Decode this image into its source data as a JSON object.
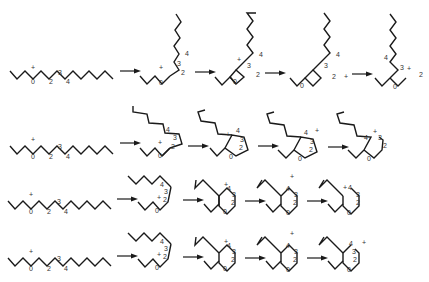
{
  "diagram": {
    "colors": {
      "bond": "#1a1a1a",
      "label": "#333333",
      "background": "#ffffff"
    },
    "rows": [
      {
        "id": "row-1",
        "description": "4-membered ring formation",
        "labels": {
          "c0": "0",
          "c2": "2",
          "c3": "3",
          "c4": "4",
          "charge": "+"
        }
      },
      {
        "id": "row-2",
        "description": "5-membered ring formation",
        "labels": {
          "c0": "0",
          "c2": "2",
          "c3": "3",
          "c4": "4",
          "charge": "+"
        }
      },
      {
        "id": "row-3",
        "description": "6-membered ring formation",
        "labels": {
          "c0": "0",
          "c2": "2",
          "c3": "3",
          "c4": "4",
          "charge": "+"
        }
      },
      {
        "id": "row-4",
        "description": "6-membered ring formation (alternate)",
        "labels": {
          "c0": "0",
          "c2": "2",
          "c3": "3",
          "c4": "4",
          "charge": "+"
        }
      }
    ]
  }
}
